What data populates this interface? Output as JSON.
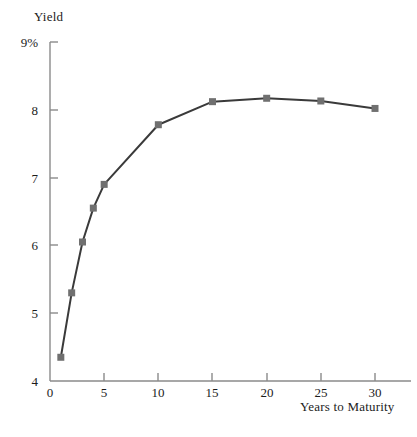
{
  "chart_data": {
    "type": "line",
    "title": "",
    "xlabel": "Years to Maturity",
    "ylabel": "Yield",
    "ylabel_unit_suffix": "%",
    "x": [
      1,
      2,
      3,
      4,
      5,
      10,
      15,
      20,
      25,
      30
    ],
    "values": [
      4.35,
      5.3,
      6.05,
      6.55,
      6.9,
      7.78,
      8.12,
      8.17,
      8.13,
      8.02
    ],
    "series": [
      {
        "name": "Yield curve",
        "x": [
          1,
          2,
          3,
          4,
          5,
          10,
          15,
          20,
          25,
          30
        ],
        "values": [
          4.35,
          5.3,
          6.05,
          6.55,
          6.9,
          7.78,
          8.12,
          8.17,
          8.13,
          8.02
        ]
      }
    ],
    "xlim": [
      0,
      30
    ],
    "ylim": [
      4,
      9
    ],
    "xticks": [
      0,
      5,
      10,
      15,
      20,
      25,
      30
    ],
    "yticks": [
      4,
      5,
      6,
      7,
      8,
      9
    ],
    "ytick_labels": [
      "4",
      "5",
      "6",
      "7",
      "8",
      "9%"
    ],
    "xtick_labels": [
      "0",
      "5",
      "10",
      "15",
      "20",
      "25",
      "30"
    ],
    "grid": false,
    "legend": false,
    "marker": "square",
    "line_color": "#3a3a3a",
    "marker_color": "#707070",
    "axis_color": "#8a8a8a"
  },
  "axes": {
    "y_title": "Yield",
    "x_title": "Years to Maturity"
  }
}
